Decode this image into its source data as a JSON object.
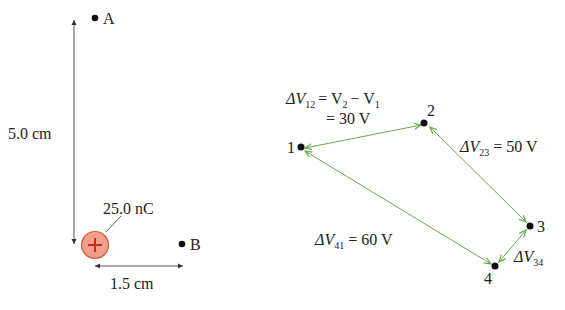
{
  "left_diagram": {
    "point_a": {
      "label": "A"
    },
    "point_b": {
      "label": "B"
    },
    "vertical_distance": "5.0 cm",
    "horizontal_distance": "1.5 cm",
    "charge": {
      "label": "25.0 nC",
      "sign": "+",
      "fill": "#f0a08a",
      "stroke": "#d2553c",
      "sign_color": "#d7261e"
    }
  },
  "right_diagram": {
    "points": [
      {
        "label": "1"
      },
      {
        "label": "2"
      },
      {
        "label": "3"
      },
      {
        "label": "4"
      }
    ],
    "arrow_color": "#6aaa50",
    "labels": {
      "dv12_prefix": "ΔV",
      "dv12_sub": "12",
      "dv12_eq": "= V",
      "dv12_v2_sub": "2",
      "dv12_minus": "− V",
      "dv12_v1_sub": "1",
      "dv12_value": "= 30 V",
      "dv23_prefix": "ΔV",
      "dv23_sub": "23",
      "dv23_value": "= 50 V",
      "dv41_prefix": "ΔV",
      "dv41_sub": "41",
      "dv41_value": "= 60 V",
      "dv34_prefix": "ΔV",
      "dv34_sub": "34"
    }
  }
}
